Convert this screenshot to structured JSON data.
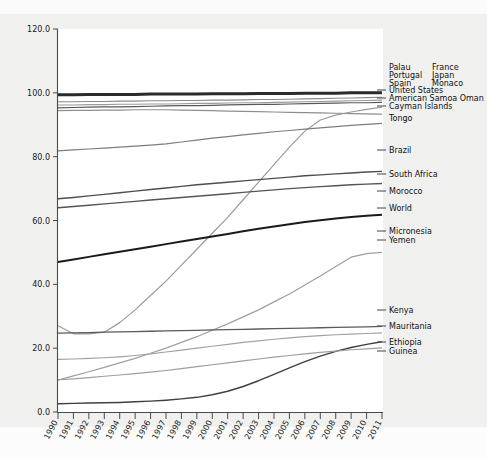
{
  "figure": {
    "background_color": "#f0f0ef",
    "plot_background_color": "#ffffff",
    "axis_color": "#4a4a4a"
  },
  "chart_data": {
    "type": "line",
    "title": "",
    "xlabel": "",
    "ylabel": "",
    "xlim": [
      1990,
      2011
    ],
    "ylim": [
      0.0,
      120.0
    ],
    "grid": false,
    "legend_position": "right-inline",
    "x": [
      1990,
      1991,
      1992,
      1993,
      1994,
      1995,
      1996,
      1997,
      1998,
      1999,
      2000,
      2001,
      2002,
      2003,
      2004,
      2005,
      2006,
      2007,
      2008,
      2009,
      2010,
      2011
    ],
    "x_tick_labels": [
      "1990",
      "1991",
      "1992",
      "1993",
      "1994",
      "1995",
      "1996",
      "1997",
      "1998",
      "1999",
      "2000",
      "2001",
      "2002",
      "2003",
      "2004",
      "2005",
      "2006",
      "2007",
      "2008",
      "2009",
      "2010",
      "2011"
    ],
    "y_tick_labels": [
      "120.0",
      "100.0",
      "80.0",
      "60.0",
      "40.0",
      "20.0",
      "0.0"
    ],
    "y_ticks": [
      120.0,
      100.0,
      80.0,
      60.0,
      40.0,
      20.0,
      0.0
    ],
    "series": [
      {
        "name": "Palau Portugal Spain France Japan Monaco",
        "legend_label": "",
        "color": "#2b2b2b",
        "width": 3.0,
        "values": [
          99.4,
          99.4,
          99.5,
          99.5,
          99.5,
          99.5,
          99.6,
          99.6,
          99.6,
          99.6,
          99.7,
          99.7,
          99.7,
          99.8,
          99.8,
          99.8,
          99.9,
          99.9,
          99.9,
          100.0,
          100.0,
          100.0
        ]
      },
      {
        "name": "United States",
        "legend_label": "United States",
        "color": "#8a8a8a",
        "width": 1.1,
        "values": [
          97.2,
          97.2,
          97.3,
          97.3,
          97.4,
          97.4,
          97.5,
          97.5,
          97.6,
          97.6,
          97.7,
          97.7,
          97.8,
          97.9,
          97.9,
          98.0,
          98.1,
          98.2,
          98.3,
          98.4,
          98.5,
          98.6
        ]
      },
      {
        "name": "American Samoa Oman",
        "legend_label": "American Samoa Oman",
        "color": "#9a9a9a",
        "width": 1.1,
        "values": [
          96.2,
          96.2,
          96.3,
          96.3,
          96.4,
          96.4,
          96.5,
          96.5,
          96.6,
          96.7,
          96.7,
          96.8,
          96.9,
          96.9,
          97.0,
          97.1,
          97.2,
          97.3,
          97.4,
          97.5,
          97.6,
          97.7
        ]
      },
      {
        "name": "Cayman Islands",
        "legend_label": "Cayman Islands",
        "color": "#585858",
        "width": 1.2,
        "values": [
          95.3,
          95.4,
          95.5,
          95.6,
          95.6,
          95.7,
          95.8,
          95.9,
          96.0,
          96.0,
          96.1,
          96.2,
          96.3,
          96.4,
          96.4,
          96.5,
          96.6,
          96.7,
          96.8,
          96.9,
          96.9,
          97.0
        ]
      },
      {
        "name": "Tongo",
        "legend_label": "Tongo",
        "color": "#8e8e8e",
        "width": 1.2,
        "values": [
          94.4,
          94.5,
          94.5,
          94.6,
          94.6,
          94.7,
          94.7,
          94.7,
          94.6,
          94.5,
          94.4,
          94.3,
          94.2,
          94.1,
          94.0,
          93.9,
          93.8,
          93.7,
          93.6,
          93.5,
          93.4,
          93.3
        ]
      },
      {
        "name": "Micronesia",
        "legend_label": "Micronesia",
        "color": "#9b9b9b",
        "width": 1.2,
        "values": [
          27.0,
          24.5,
          24.5,
          25.0,
          28.0,
          32.0,
          36.5,
          41.0,
          46.0,
          51.0,
          56.0,
          61.0,
          66.5,
          72.0,
          77.5,
          83.0,
          88.0,
          91.5,
          93.0,
          94.0,
          94.8,
          95.5
        ]
      },
      {
        "name": "Brazil",
        "legend_label": "Brazil",
        "color": "#7d7d7d",
        "width": 1.2,
        "values": [
          81.8,
          82.1,
          82.4,
          82.7,
          83.0,
          83.3,
          83.6,
          84.0,
          84.6,
          85.2,
          85.8,
          86.3,
          86.8,
          87.3,
          87.8,
          88.2,
          88.6,
          89.0,
          89.4,
          89.8,
          90.1,
          90.4
        ]
      },
      {
        "name": "South Africa",
        "legend_label": "South Africa",
        "color": "#4e4e4e",
        "width": 1.4,
        "values": [
          66.8,
          67.2,
          67.7,
          68.2,
          68.7,
          69.2,
          69.7,
          70.2,
          70.7,
          71.2,
          71.6,
          72.0,
          72.4,
          72.8,
          73.2,
          73.6,
          74.0,
          74.3,
          74.6,
          74.9,
          75.2,
          75.4
        ]
      },
      {
        "name": "Morocco",
        "legend_label": "Morocco",
        "color": "#555555",
        "width": 1.4,
        "values": [
          64.0,
          64.4,
          64.8,
          65.2,
          65.6,
          66.0,
          66.4,
          66.8,
          67.2,
          67.6,
          68.0,
          68.4,
          68.8,
          69.2,
          69.6,
          70.0,
          70.3,
          70.6,
          70.9,
          71.2,
          71.4,
          71.6
        ]
      },
      {
        "name": "World",
        "legend_label": "World",
        "color": "#1a1a1a",
        "width": 2.0,
        "values": [
          47.0,
          47.8,
          48.6,
          49.4,
          50.2,
          51.0,
          51.8,
          52.6,
          53.4,
          54.2,
          55.0,
          55.8,
          56.6,
          57.4,
          58.1,
          58.8,
          59.5,
          60.1,
          60.6,
          61.1,
          61.5,
          61.8
        ]
      },
      {
        "name": "Yemen",
        "legend_label": "Yemen",
        "color": "#9f9f9f",
        "width": 1.2,
        "values": [
          10.0,
          11.3,
          12.6,
          14.0,
          15.4,
          16.8,
          18.4,
          20.0,
          21.8,
          23.6,
          25.6,
          27.6,
          29.8,
          32.0,
          34.5,
          37.0,
          39.8,
          42.6,
          45.6,
          48.5,
          49.6,
          50.0
        ]
      },
      {
        "name": "Kenya",
        "legend_label": "Kenya",
        "color": "#5a5a5a",
        "width": 1.3,
        "values": [
          24.7,
          24.8,
          24.9,
          25.0,
          25.1,
          25.2,
          25.3,
          25.4,
          25.5,
          25.6,
          25.7,
          25.8,
          25.9,
          26.0,
          26.1,
          26.2,
          26.3,
          26.4,
          26.5,
          26.6,
          26.7,
          26.8
        ]
      },
      {
        "name": "Mauritania",
        "legend_label": "Mauritania",
        "color": "#a2a2a2",
        "width": 1.2,
        "values": [
          16.5,
          16.6,
          16.8,
          17.0,
          17.3,
          17.7,
          18.2,
          18.8,
          19.4,
          20.0,
          20.6,
          21.2,
          21.8,
          22.3,
          22.8,
          23.2,
          23.6,
          23.9,
          24.2,
          24.4,
          24.6,
          24.8
        ]
      },
      {
        "name": "Ethiopia",
        "legend_label": "Ethiopia",
        "color": "#3f3f3f",
        "width": 1.4,
        "values": [
          2.6,
          2.7,
          2.8,
          2.9,
          3.0,
          3.2,
          3.4,
          3.7,
          4.1,
          4.6,
          5.4,
          6.5,
          8.0,
          9.8,
          11.8,
          13.8,
          15.8,
          17.5,
          19.0,
          20.2,
          21.2,
          22.0
        ]
      },
      {
        "name": "Guinea",
        "legend_label": "Guinea",
        "color": "#9d9d9d",
        "width": 1.2,
        "values": [
          10.1,
          10.4,
          10.8,
          11.2,
          11.6,
          12.0,
          12.5,
          13.0,
          13.6,
          14.2,
          14.8,
          15.4,
          16.0,
          16.6,
          17.2,
          17.7,
          18.2,
          18.7,
          19.1,
          19.5,
          19.8,
          20.1
        ]
      }
    ]
  },
  "legend": {
    "header_block": {
      "col1": [
        "Palau",
        "Portugal",
        "Spain"
      ],
      "col2": [
        "France",
        "Japan",
        "Monaco"
      ]
    },
    "entries": [
      {
        "label": "United States",
        "y": 93,
        "swatch": true
      },
      {
        "label": "American Samoa Oman",
        "y": 101,
        "swatch": true
      },
      {
        "label": "Cayman Islands",
        "y": 109,
        "swatch": true
      },
      {
        "label": "Tongo",
        "y": 121,
        "swatch": false
      },
      {
        "label": "Brazil",
        "y": 153,
        "swatch": true
      },
      {
        "label": "South Africa",
        "y": 177,
        "swatch": true
      },
      {
        "label": "Morocco",
        "y": 194,
        "swatch": true
      },
      {
        "label": "World",
        "y": 211,
        "swatch": true
      },
      {
        "label": "Micronesia",
        "y": 234,
        "swatch": true
      },
      {
        "label": "Yemen",
        "y": 243,
        "swatch": true
      },
      {
        "label": "Kenya",
        "y": 313,
        "swatch": true
      },
      {
        "label": "Mauritania",
        "y": 329,
        "swatch": true
      },
      {
        "label": "Ethiopia",
        "y": 345,
        "swatch": true
      },
      {
        "label": "Guinea",
        "y": 354,
        "swatch": true
      }
    ]
  }
}
